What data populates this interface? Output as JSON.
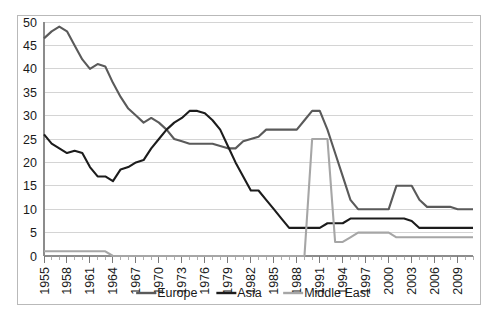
{
  "chart_data": {
    "type": "line",
    "title": "",
    "subtitle": "",
    "xlabel": "",
    "ylabel": "",
    "xlim": [
      1955,
      2011
    ],
    "ylim": [
      0,
      50
    ],
    "ytick_step": 5,
    "xtick_step": 3,
    "grid": "horizontal",
    "legend_position": "bottom",
    "yticks": [
      "0",
      "5",
      "10",
      "15",
      "20",
      "25",
      "30",
      "35",
      "40",
      "45",
      "50"
    ],
    "xticks": [
      "1955",
      "1958",
      "1961",
      "1964",
      "1967",
      "1970",
      "1973",
      "1976",
      "1979",
      "1982",
      "1985",
      "1988",
      "1991",
      "1994",
      "1997",
      "2000",
      "2003",
      "2006",
      "2009"
    ],
    "x": [
      1955,
      1956,
      1957,
      1958,
      1959,
      1960,
      1961,
      1962,
      1963,
      1964,
      1965,
      1966,
      1967,
      1968,
      1969,
      1970,
      1971,
      1972,
      1973,
      1974,
      1975,
      1976,
      1977,
      1978,
      1979,
      1980,
      1981,
      1982,
      1983,
      1984,
      1985,
      1986,
      1987,
      1988,
      1989,
      1990,
      1991,
      1992,
      1993,
      1994,
      1995,
      1996,
      1997,
      1998,
      1999,
      2000,
      2001,
      2002,
      2003,
      2004,
      2005,
      2006,
      2007,
      2008,
      2009,
      2010,
      2011
    ],
    "series": [
      {
        "name": "Europe",
        "color": "#5a5a5a",
        "width": 2.1,
        "values": [
          46.5,
          48.0,
          49.0,
          48.0,
          45.0,
          42.0,
          40.0,
          41.0,
          40.5,
          37.0,
          34.0,
          31.5,
          30.0,
          28.5,
          29.5,
          28.5,
          27.0,
          25.0,
          24.5,
          24.0,
          24.0,
          24.0,
          24.0,
          23.5,
          23.0,
          23.0,
          24.5,
          25.0,
          25.5,
          27.0,
          27.0,
          27.0,
          27.0,
          27.0,
          29.0,
          31.0,
          31.0,
          27.0,
          22.0,
          17.0,
          12.0,
          10.0,
          10.0,
          10.0,
          10.0,
          10.0,
          15.0,
          15.0,
          15.0,
          12.0,
          10.5,
          10.5,
          10.5,
          10.5,
          10.0,
          10.0,
          10.0
        ]
      },
      {
        "name": "Asia",
        "color": "#1c1c1c",
        "width": 2.1,
        "values": [
          26.0,
          24.0,
          23.0,
          22.0,
          22.5,
          22.0,
          19.0,
          17.0,
          17.0,
          16.0,
          18.5,
          19.0,
          20.0,
          20.5,
          23.0,
          25.0,
          27.0,
          28.5,
          29.5,
          31.0,
          31.0,
          30.5,
          29.0,
          27.0,
          23.5,
          20.0,
          17.0,
          14.0,
          14.0,
          12.0,
          10.0,
          8.0,
          6.0,
          6.0,
          6.0,
          6.0,
          6.0,
          7.0,
          7.0,
          7.0,
          8.0,
          8.0,
          8.0,
          8.0,
          8.0,
          8.0,
          8.0,
          8.0,
          7.5,
          6.0,
          6.0,
          6.0,
          6.0,
          6.0,
          6.0,
          6.0,
          6.0
        ]
      },
      {
        "name": "Middle East",
        "color": "#a6a6a6",
        "width": 2.1,
        "values": [
          1.0,
          1.0,
          1.0,
          1.0,
          1.0,
          1.0,
          1.0,
          1.0,
          1.0,
          0.0,
          0.0,
          0.0,
          0.0,
          0.0,
          0.0,
          0.0,
          0.0,
          0.0,
          0.0,
          0.0,
          0.0,
          0.0,
          0.0,
          0.0,
          0.0,
          0.0,
          0.0,
          0.0,
          0.0,
          0.0,
          0.0,
          0.0,
          0.0,
          0.0,
          0.0,
          25.0,
          25.0,
          25.0,
          3.0,
          3.0,
          4.0,
          5.0,
          5.0,
          5.0,
          5.0,
          5.0,
          4.0,
          4.0,
          4.0,
          4.0,
          4.0,
          4.0,
          4.0,
          4.0,
          4.0,
          4.0,
          4.0
        ]
      }
    ]
  },
  "legend": {
    "entries": [
      {
        "label": "Europe",
        "color": "#5a5a5a"
      },
      {
        "label": "Asia",
        "color": "#1c1c1c"
      },
      {
        "label": "Middle East",
        "color": "#a6a6a6"
      }
    ]
  }
}
